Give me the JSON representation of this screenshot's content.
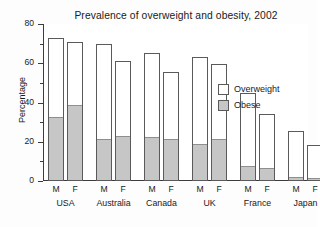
{
  "chart_data": {
    "type": "bar",
    "title": "Prevalence of overweight and obesity, 2002",
    "subtitle": "Data based on BMI assessment for persons 15 years or over, WHO 2005",
    "xlabel": "",
    "ylabel": "Percentage",
    "ylim": [
      0,
      80
    ],
    "yticks": [
      0,
      20,
      40,
      60,
      80
    ],
    "yticks_minor": [
      10,
      30,
      50,
      70
    ],
    "grid": false,
    "legend_position": "inside-right",
    "stacked": true,
    "categories": [
      "USA M",
      "USA F",
      "Australia M",
      "Australia F",
      "Canada M",
      "Canada F",
      "UK M",
      "UK F",
      "France M",
      "France F",
      "Japan M",
      "Japan F"
    ],
    "groups": [
      {
        "country": "USA",
        "sexes": [
          "M",
          "F"
        ]
      },
      {
        "country": "Australia",
        "sexes": [
          "M",
          "F"
        ]
      },
      {
        "country": "Canada",
        "sexes": [
          "M",
          "F"
        ]
      },
      {
        "country": "UK",
        "sexes": [
          "M",
          "F"
        ]
      },
      {
        "country": "France",
        "sexes": [
          "M",
          "F"
        ]
      },
      {
        "country": "Japan",
        "sexes": [
          "M",
          "F"
        ]
      }
    ],
    "series": [
      {
        "name": "Overweight",
        "color": "#ffffff",
        "note": "total bar height = overweight including obese",
        "values": [
          73,
          71,
          70,
          61,
          65,
          55.5,
          63,
          59.5,
          45,
          34,
          25.5,
          18.5
        ]
      },
      {
        "name": "Obese",
        "color": "#c6c6c6",
        "values": [
          32,
          38,
          21,
          22.5,
          22,
          21,
          18.5,
          21,
          7,
          6,
          1.5,
          1
        ]
      }
    ],
    "legend": [
      {
        "label": "Overweight",
        "color": "#ffffff"
      },
      {
        "label": "Obese",
        "color": "#c6c6c6"
      }
    ]
  }
}
